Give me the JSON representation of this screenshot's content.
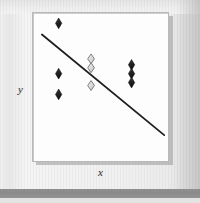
{
  "figure": {
    "title": "",
    "background_color": "#eeeeee",
    "panel_color": "#fdfdfd",
    "bottom_bar_color": "#8a8a8a"
  },
  "axes": {
    "x_label": "x",
    "y_label": "y"
  },
  "chart_data": {
    "type": "scatter",
    "title": "",
    "xlabel": "x",
    "ylabel": "y",
    "xlim": [
      0,
      1
    ],
    "ylim": [
      0,
      1
    ],
    "grid": false,
    "legend": null,
    "axis_ticks": {
      "x": [],
      "y": []
    },
    "series": [
      {
        "name": "filled-diamonds",
        "marker": "diamond",
        "marker_style": "filled",
        "marker_color": "#2b2b2b",
        "points": [
          {
            "x": 0.19,
            "y": 0.93
          },
          {
            "x": 0.19,
            "y": 0.59
          },
          {
            "x": 0.19,
            "y": 0.45
          },
          {
            "x": 0.73,
            "y": 0.65
          },
          {
            "x": 0.73,
            "y": 0.59
          },
          {
            "x": 0.73,
            "y": 0.53
          }
        ]
      },
      {
        "name": "open-diamonds",
        "marker": "diamond",
        "marker_style": "open",
        "marker_color": "#d6d6d6",
        "marker_edge_color": "#6f6f6f",
        "points": [
          {
            "x": 0.43,
            "y": 0.69
          },
          {
            "x": 0.43,
            "y": 0.63
          },
          {
            "x": 0.43,
            "y": 0.51
          }
        ]
      }
    ],
    "trendline": {
      "name": "regression-line",
      "color": "#1f1f1f",
      "width": 1.8,
      "x_start": 0.066,
      "y_start": 0.855,
      "x_end": 0.972,
      "y_end": 0.175,
      "slope_sign": "negative"
    }
  }
}
